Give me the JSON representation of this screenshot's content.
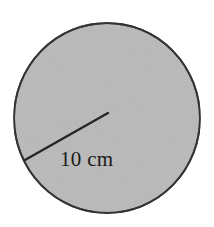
{
  "figure": {
    "name": "shaded-circle-with-radius",
    "background_color": "#ffffff",
    "circle": {
      "fill_color": "#b9b9b9",
      "stroke_color": "#333333",
      "stroke_width": 2,
      "center_x": 107,
      "center_y": 118,
      "radius_x": 93,
      "radius_y": 95
    },
    "radius_line": {
      "color": "#262626",
      "width": 2.4,
      "x1": 108,
      "y1": 113,
      "x2": 25,
      "y2": 160
    },
    "radius_label": {
      "text": "10 cm",
      "x": 60,
      "y": 166,
      "font_size": 21,
      "color": "#1a1a1a"
    }
  }
}
